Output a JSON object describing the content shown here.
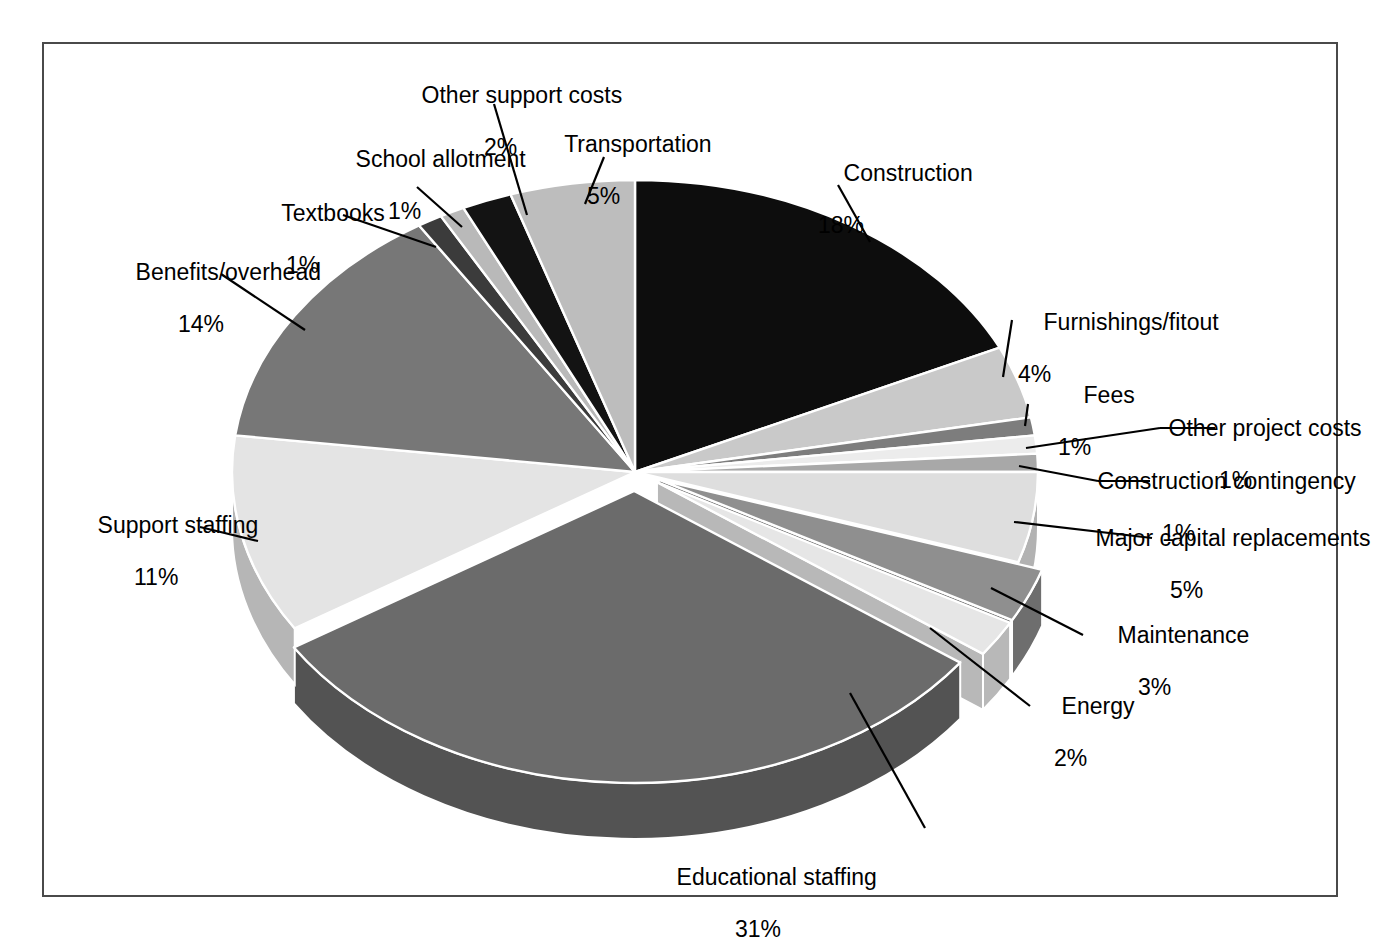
{
  "chart_data": {
    "type": "pie",
    "title": "",
    "subtitle": "",
    "xlabel": "",
    "ylabel": "",
    "legend_position": "callout-labels",
    "grid": false,
    "value_suffix": "%",
    "total": 100,
    "start_angle_deg": 0,
    "direction": "clockwise",
    "three_d": true,
    "categories": [
      "Construction",
      "Furnishings/fitout",
      "Fees",
      "Other project costs",
      "Construction contingency",
      "Major capital replacements",
      "Maintenance",
      "Energy",
      "Educational staffing",
      "Support staffing",
      "Benefits/overhead",
      "Textbooks",
      "School allotment",
      "Other support costs",
      "Transportation"
    ],
    "values": [
      18,
      4,
      1,
      1,
      1,
      5,
      3,
      2,
      31,
      11,
      14,
      1,
      1,
      2,
      5
    ],
    "slices": [
      {
        "label": "Construction",
        "value": 18,
        "pct_text": "18%",
        "color": "#0d0d0d",
        "side": "#000000",
        "exploded": false
      },
      {
        "label": "Furnishings/fitout",
        "value": 4,
        "pct_text": "4%",
        "color": "#c9c9c9",
        "side": "#9f9f9f",
        "exploded": false
      },
      {
        "label": "Fees",
        "value": 1,
        "pct_text": "1%",
        "color": "#7d7d7d",
        "side": "#5e5e5e",
        "exploded": false
      },
      {
        "label": "Other project costs",
        "value": 1,
        "pct_text": "1%",
        "color": "#ececec",
        "side": "#bdbdbd",
        "exploded": false
      },
      {
        "label": "Construction contingency",
        "value": 1,
        "pct_text": "1%",
        "color": "#a8a8a8",
        "side": "#858585",
        "exploded": false
      },
      {
        "label": "Major capital replacements",
        "value": 5,
        "pct_text": "5%",
        "color": "#dedede",
        "side": "#b2b2b2",
        "exploded": false
      },
      {
        "label": "Maintenance",
        "value": 3,
        "pct_text": "3%",
        "color": "#8f8f8f",
        "side": "#6e6e6e",
        "exploded": true
      },
      {
        "label": "Energy",
        "value": 2,
        "pct_text": "2%",
        "color": "#e6e6e6",
        "side": "#b8b8b8",
        "exploded": true
      },
      {
        "label": "Educational staffing",
        "value": 31,
        "pct_text": "31%",
        "color": "#6b6b6b",
        "side": "#535353",
        "exploded": true
      },
      {
        "label": "Support staffing",
        "value": 11,
        "pct_text": "11%",
        "color": "#e4e4e4",
        "side": "#b6b6b6",
        "exploded": false
      },
      {
        "label": "Benefits/overhead",
        "value": 14,
        "pct_text": "14%",
        "color": "#777777",
        "side": "#5b5b5b",
        "exploded": false
      },
      {
        "label": "Textbooks",
        "value": 1,
        "pct_text": "1%",
        "color": "#3b3b3b",
        "side": "#2c2c2c",
        "exploded": false
      },
      {
        "label": "School allotment",
        "value": 1,
        "pct_text": "1%",
        "color": "#b9b9b9",
        "side": "#949494",
        "exploded": false
      },
      {
        "label": "Other support costs",
        "value": 2,
        "pct_text": "2%",
        "color": "#131313",
        "side": "#000000",
        "exploded": false
      },
      {
        "label": "Transportation",
        "value": 5,
        "pct_text": "5%",
        "color": "#bdbdbd",
        "side": "#969696",
        "exploded": false
      }
    ]
  },
  "labels": {
    "construction": {
      "name": "Construction",
      "pct": "18%"
    },
    "furnishings": {
      "name": "Furnishings/fitout",
      "pct": "4%"
    },
    "fees": {
      "name": "Fees",
      "pct": "1%"
    },
    "other_project_costs": {
      "name": "Other project costs",
      "pct": "1%"
    },
    "construction_contingency": {
      "name": "Construction contingency",
      "pct": "1%"
    },
    "major_capital": {
      "name": "Major capital replacements",
      "pct": "5%"
    },
    "maintenance": {
      "name": "Maintenance",
      "pct": "3%"
    },
    "energy": {
      "name": "Energy",
      "pct": "2%"
    },
    "educational_staffing": {
      "name": "Educational staffing",
      "pct": "31%"
    },
    "support_staffing": {
      "name": "Support staffing",
      "pct": "11%"
    },
    "benefits_overhead": {
      "name": "Benefits/overhead",
      "pct": "14%"
    },
    "textbooks": {
      "name": "Textbooks",
      "pct": "1%"
    },
    "school_allotment": {
      "name": "School allotment",
      "pct": "1%"
    },
    "other_support_costs": {
      "name": "Other support costs",
      "pct": "2%"
    },
    "transportation": {
      "name": "Transportation",
      "pct": "5%"
    }
  },
  "style": {
    "frame_color": "#4a4a4a",
    "background": "#ffffff",
    "separator_color": "#ffffff",
    "leader_color": "#000000"
  }
}
